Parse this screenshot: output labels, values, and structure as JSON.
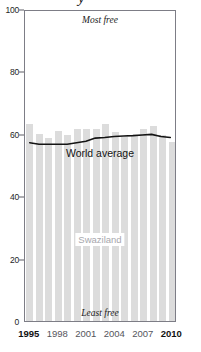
{
  "title_descender_glyph": "y",
  "annotations": {
    "most_free": "Most free",
    "least_free": "Least free"
  },
  "series_labels": {
    "world": "World average",
    "country": "Swaziland"
  },
  "colors": {
    "bar": "#dcdcdc",
    "line": "#141414",
    "frame": "#7d7d86",
    "country_label": "#a7a7ad"
  },
  "chart_data": {
    "type": "bar",
    "title": "",
    "xlabel": "",
    "ylabel": "",
    "ylim": [
      0,
      100
    ],
    "xlim": [
      1995,
      2010
    ],
    "grid": false,
    "legend": "inline-labels",
    "yticks": [
      0,
      20,
      40,
      60,
      80,
      100
    ],
    "ytick_labels": [
      "0",
      "20",
      "40",
      "60",
      "80",
      "100"
    ],
    "xticks": [
      1995,
      1998,
      2001,
      2004,
      2007,
      2010
    ],
    "xtick_labels": [
      "1995",
      "1998",
      "2001",
      "2004",
      "2007",
      "2010"
    ],
    "categories": [
      1995,
      1996,
      1997,
      1998,
      1999,
      2000,
      2001,
      2002,
      2003,
      2004,
      2005,
      2006,
      2007,
      2008,
      2009,
      2010
    ],
    "series": [
      {
        "name": "Swaziland",
        "type": "bar",
        "values": [
          63,
          60,
          58.5,
          61,
          59.5,
          61.5,
          61.5,
          61.5,
          63,
          60.5,
          59,
          59.5,
          61.5,
          62.5,
          59.5,
          57.5
        ]
      },
      {
        "name": "World average",
        "type": "line",
        "values": [
          57.5,
          57,
          57,
          57,
          57,
          57.5,
          58,
          59,
          59.2,
          59.5,
          59.7,
          59.8,
          60,
          60.2,
          59.5,
          59.2
        ]
      }
    ],
    "annotations": [
      {
        "text": "Most free",
        "position": "top-center"
      },
      {
        "text": "Least free",
        "position": "bottom-center"
      }
    ]
  }
}
